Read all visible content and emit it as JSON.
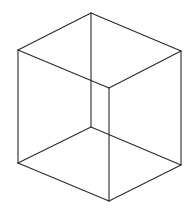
{
  "diagram": {
    "type": "necker-cube-wireframe",
    "stroke_color": "#2a2a2a",
    "background": "#ffffff",
    "vertices": {
      "top_back": [
        91,
        13
      ],
      "left_upper": [
        18,
        50
      ],
      "right_upper": [
        181,
        51
      ],
      "front_upper": [
        109,
        88
      ],
      "back_lower": [
        91,
        127
      ],
      "left_lower": [
        18,
        163
      ],
      "right_lower": [
        181,
        165
      ],
      "front_lower": [
        109,
        201
      ]
    },
    "edges": [
      [
        "top_back",
        "left_upper"
      ],
      [
        "top_back",
        "right_upper"
      ],
      [
        "left_upper",
        "front_upper"
      ],
      [
        "right_upper",
        "front_upper"
      ],
      [
        "top_back",
        "back_lower"
      ],
      [
        "left_upper",
        "left_lower"
      ],
      [
        "right_upper",
        "right_lower"
      ],
      [
        "front_upper",
        "front_lower"
      ],
      [
        "back_lower",
        "left_lower"
      ],
      [
        "back_lower",
        "right_lower"
      ],
      [
        "left_lower",
        "front_lower"
      ],
      [
        "right_lower",
        "front_lower"
      ]
    ]
  }
}
